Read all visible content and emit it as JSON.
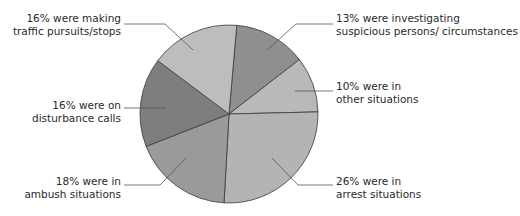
{
  "chart_data": {
    "type": "pie",
    "title": "",
    "slices": [
      {
        "label": "were investigating suspicious persons/ circumstances",
        "value": 13,
        "color": "#8f8f8f"
      },
      {
        "label": "were in other situations",
        "value": 10,
        "color": "#b9b9b9"
      },
      {
        "label": "were in arrest situations",
        "value": 26,
        "color": "#b4b4b4"
      },
      {
        "label": "were in ambush situations",
        "value": 18,
        "color": "#9a9a9a"
      },
      {
        "label": "were on disturbance calls",
        "value": 16,
        "color": "#7e7e7e"
      },
      {
        "label": "were making traffic pursuits/stops",
        "value": 16,
        "color": "#bdbdbd"
      }
    ],
    "start_angle_deg": 5,
    "legend": "none (leader-line labels)"
  },
  "labels": {
    "investigating": {
      "line1": "13% were investigating",
      "line2": "suspicious persons/ circumstances"
    },
    "other": {
      "line1": "10% were in",
      "line2": "other situations"
    },
    "arrest": {
      "line1": "26% were in",
      "line2": "arrest situations"
    },
    "ambush": {
      "line1": "18% were in",
      "line2": "ambush situations"
    },
    "disturbance": {
      "line1": "16% were on",
      "line2": "disturbance calls"
    },
    "traffic": {
      "line1": "16% were making",
      "line2": "traffic pursuits/stops"
    }
  }
}
